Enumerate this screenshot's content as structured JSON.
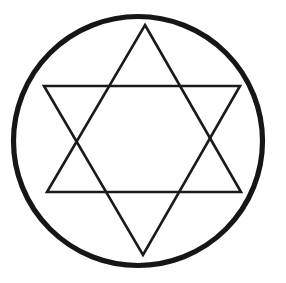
{
  "figure": {
    "canvas": {
      "width": 286,
      "height": 283,
      "background_color": "#ffffff"
    },
    "colors": {
      "stroke": "#1a1a1a",
      "circle_stroke": "#161616",
      "fill": "none",
      "background": "#ffffff"
    },
    "shapes": {
      "circle": {
        "name": "enclosing-circle",
        "cx": 138,
        "cy": 141,
        "r": 124.5,
        "stroke_width": 5.2,
        "fill": "none"
      },
      "triangle_up": {
        "name": "upward-triangle",
        "points": "145,25 241,192 47,192",
        "stroke_width": 2.6,
        "fill": "none"
      },
      "triangle_down": {
        "name": "downward-triangle",
        "points": "44,86 240,86 143,255",
        "stroke_width": 2.6,
        "fill": "none"
      }
    }
  }
}
